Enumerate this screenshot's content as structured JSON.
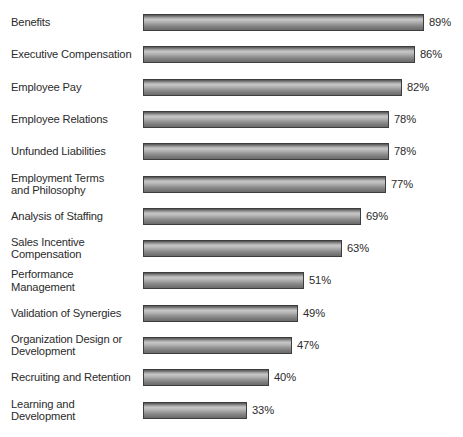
{
  "chart_data": {
    "type": "bar",
    "orientation": "horizontal",
    "title": "",
    "subtitle": "",
    "xlabel": "",
    "ylabel": "",
    "xlim": [
      0,
      100
    ],
    "grid": false,
    "legend": null,
    "value_suffix": "%",
    "categories": [
      "Benefits",
      "Executive Compensation",
      "Employee Pay",
      "Employee Relations",
      "Unfunded Liabilities",
      "Employment Terms\nand Philosophy",
      "Analysis of Staffing",
      "Sales Incentive\nCompensation",
      "Performance\nManagement",
      "Validation of Synergies",
      "Organization Design or\nDevelopment",
      "Recruiting and Retention",
      "Learning and\nDevelopment"
    ],
    "values": [
      89,
      86,
      82,
      78,
      78,
      77,
      69,
      63,
      51,
      49,
      47,
      40,
      33
    ],
    "value_labels": [
      "89%",
      "86%",
      "82%",
      "78%",
      "78%",
      "77%",
      "69%",
      "63%",
      "51%",
      "49%",
      "47%",
      "40%",
      "33%"
    ],
    "colors": {
      "bar_light": "#c6c6c6",
      "bar_dark": "#555555",
      "bar_outline": "#3d3d3d",
      "text": "#2b2b2b",
      "background": "#ffffff"
    }
  }
}
